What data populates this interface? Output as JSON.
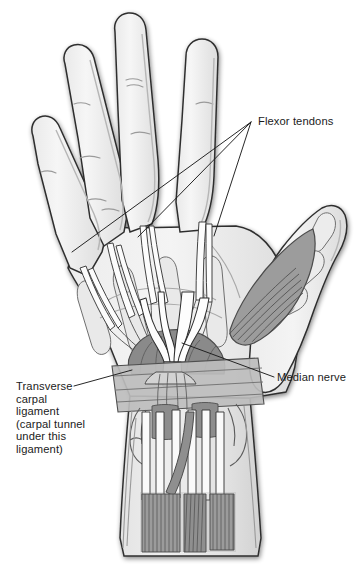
{
  "figure": {
    "background_color": "#ffffff",
    "width": 361,
    "height": 572
  },
  "labels": {
    "flexor_tendons": "Flexor tendons",
    "median_nerve": "Median nerve",
    "transverse_carpal_ligament": "Transverse\ncarpal\nligament\n(carpal tunnel\nunder this\nligament)"
  },
  "colors": {
    "outline": "#2b2b2b",
    "skin_fill": "#f0f0f0",
    "skin_shadow": "#d8d8d8",
    "palm_mid": "#dedede",
    "ligament_band": "#b9b9b9",
    "muscle_dark": "#8e8e8e",
    "muscle_stripe": "#545454",
    "carpal_dark": "#7f7f7f",
    "nerve_white": "#fefefe",
    "tendon_fill": "#fbfbfb",
    "bone_fill": "#e6e6e6",
    "leader_line": "#1b1b1b",
    "text": "#1b1b1b"
  },
  "structures": {
    "digits": [
      {
        "name": "index-finger"
      },
      {
        "name": "middle-finger"
      },
      {
        "name": "ring-finger"
      },
      {
        "name": "little-finger"
      },
      {
        "name": "thumb"
      }
    ],
    "regions": [
      {
        "name": "palm"
      },
      {
        "name": "thenar-eminence"
      },
      {
        "name": "carpal-tunnel"
      },
      {
        "name": "forearm"
      }
    ]
  },
  "leaders": {
    "flexor_tendons_lines": 3,
    "median_nerve_lines": 1,
    "transverse_carpal_lines": 1
  }
}
